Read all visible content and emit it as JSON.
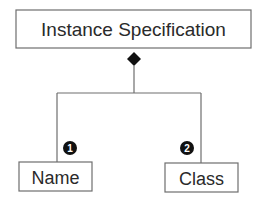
{
  "diagram": {
    "type": "UML composition",
    "parent": {
      "label": "Instance Specification"
    },
    "relationship": "composition",
    "children": [
      {
        "label": "Name",
        "badge": "1"
      },
      {
        "label": "Class",
        "badge": "2"
      }
    ]
  }
}
